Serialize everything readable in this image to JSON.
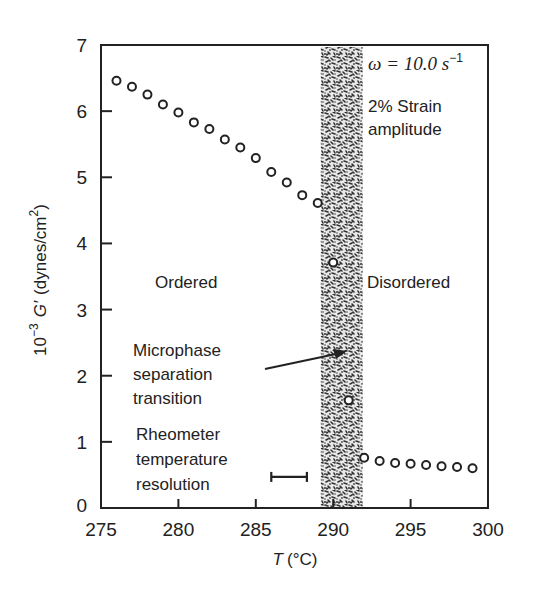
{
  "chart_data": {
    "type": "scatter",
    "title": "",
    "xlabel": "T (°C)",
    "xlabel_italic": "T",
    "xlabel_unit": "(°C)",
    "ylabel": "10^-3 G′ (dynes/cm²)",
    "ylabel_parts": {
      "base": "10",
      "exp": "−3",
      "var": "G′",
      "unit": "(dynes/cm",
      "unit_exp": "2",
      "unit_close": ")"
    },
    "xlim": [
      275,
      300
    ],
    "ylim": [
      0,
      7
    ],
    "xticks": [
      275,
      280,
      285,
      290,
      295,
      300
    ],
    "yticks": [
      0,
      1,
      2,
      3,
      4,
      5,
      6,
      7
    ],
    "grid": false,
    "marker": "open-circle",
    "series": [
      {
        "name": "Ordered",
        "x": [
          276,
          277,
          278,
          279,
          280,
          281,
          282,
          283,
          284,
          285,
          286,
          287,
          288,
          289
        ],
        "y": [
          6.46,
          6.37,
          6.25,
          6.1,
          5.98,
          5.83,
          5.73,
          5.57,
          5.45,
          5.29,
          5.08,
          4.92,
          4.73,
          4.61
        ]
      },
      {
        "name": "Transition region",
        "x": [
          290,
          291
        ],
        "y": [
          3.71,
          1.63
        ]
      },
      {
        "name": "Disordered",
        "x": [
          292,
          293,
          294,
          295,
          296,
          297,
          298,
          299
        ],
        "y": [
          0.76,
          0.71,
          0.68,
          0.67,
          0.65,
          0.63,
          0.62,
          0.6
        ]
      }
    ],
    "shaded_band": {
      "x_start": 289.2,
      "x_end": 291.9,
      "label": "Microphase separation transition"
    },
    "error_bar": {
      "x_start": 286.0,
      "x_end": 288.3,
      "y": 0.47,
      "label": "Rheometer temperature resolution"
    },
    "annotations": [
      {
        "id": "omega",
        "text_pre": "ω = 10.0 s",
        "text_sup": "−1"
      },
      {
        "id": "strain_1",
        "text": "2% Strain"
      },
      {
        "id": "strain_2",
        "text": "amplitude"
      },
      {
        "id": "ordered",
        "text": "Ordered"
      },
      {
        "id": "disordered",
        "text": "Disordered"
      },
      {
        "id": "mst_1",
        "text": "Microphase"
      },
      {
        "id": "mst_2",
        "text": "separation"
      },
      {
        "id": "mst_3",
        "text": "transition"
      },
      {
        "id": "rheo_1",
        "text": "Rheometer"
      },
      {
        "id": "rheo_2",
        "text": "temperature"
      },
      {
        "id": "rheo_3",
        "text": "resolution"
      }
    ],
    "colors": {
      "ink": "#222222",
      "band": "#3a3a3a",
      "background": "#ffffff"
    }
  }
}
